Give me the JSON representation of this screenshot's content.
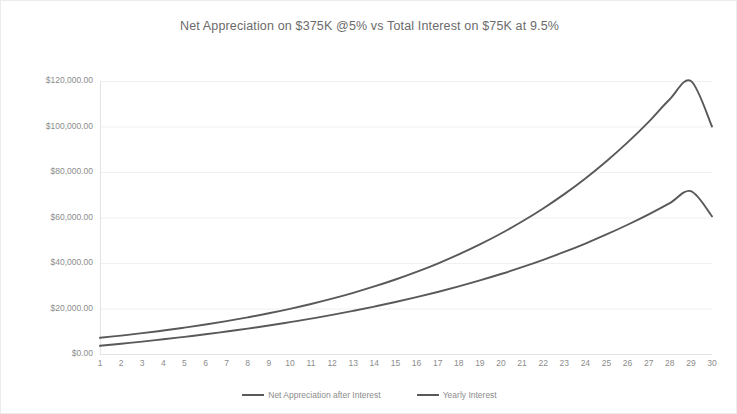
{
  "chart_data": {
    "type": "line",
    "title": "Net Appreciation on $375K @5% vs Total Interest on $75K at 9.5%",
    "xlabel": "",
    "ylabel": "",
    "grid": true,
    "legend_position": "bottom",
    "xlim": [
      1,
      30
    ],
    "ylim": [
      0,
      120000
    ],
    "categories": [
      1,
      2,
      3,
      4,
      5,
      6,
      7,
      8,
      9,
      10,
      11,
      12,
      13,
      14,
      15,
      16,
      17,
      18,
      19,
      20,
      21,
      22,
      23,
      24,
      25,
      26,
      27,
      28,
      29,
      30
    ],
    "x_tick_labels": [
      "1",
      "2",
      "3",
      "4",
      "5",
      "6",
      "7",
      "8",
      "9",
      "10",
      "11",
      "12",
      "13",
      "14",
      "15",
      "16",
      "17",
      "18",
      "19",
      "20",
      "21",
      "22",
      "23",
      "24",
      "25",
      "26",
      "27",
      "28",
      "29",
      "30"
    ],
    "y_tick_labels": [
      "$0.00",
      "$20,000.00",
      "$40,000.00",
      "$60,000.00",
      "$80,000.00",
      "$100,000.00",
      "$120,000.00"
    ],
    "y_tick_values": [
      0,
      20000,
      40000,
      60000,
      80000,
      100000,
      120000
    ],
    "series": [
      {
        "name": "Net Appreciation after Interest",
        "color": "#595959",
        "values": [
          3600,
          4500,
          5450,
          6460,
          7530,
          8670,
          9880,
          11170,
          12540,
          14000,
          15550,
          17200,
          18960,
          20840,
          22840,
          24980,
          27270,
          29720,
          32340,
          35150,
          38160,
          41390,
          44850,
          48560,
          52540,
          56810,
          61390,
          66310,
          71580,
          60500
        ]
      },
      {
        "name": "Yearly Interest",
        "color": "#595959",
        "values": [
          7125,
          8100,
          9160,
          10320,
          11580,
          12960,
          14460,
          16100,
          17890,
          19850,
          21990,
          24330,
          26890,
          29690,
          32750,
          36100,
          39770,
          43780,
          48170,
          52970,
          58230,
          63980,
          70280,
          77180,
          84730,
          93000,
          102060,
          112000,
          122900,
          100000
        ]
      }
    ]
  },
  "legend": {
    "items": [
      {
        "label": "Net Appreciation after Interest"
      },
      {
        "label": "Yearly Interest"
      }
    ]
  },
  "colors": {
    "line": "#595959",
    "grid": "#f0f0f0",
    "axis": "#e3e3e3",
    "text": "#8c8c8c",
    "title_text": "#6b6b6b"
  }
}
